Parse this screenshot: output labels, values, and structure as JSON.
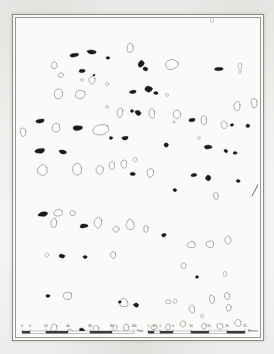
{
  "document": {
    "type": "archaeological-site-plan",
    "media": "scanned printed page",
    "paper_color": "#f4f3f1",
    "ink_color": "#1a1a1a",
    "outline_color": "#6b6966",
    "frame_color": "#8e8c89"
  },
  "map": {
    "north_arrow": {
      "name": "north-arrow",
      "label": "N",
      "bearing_deg": 28,
      "x": 236,
      "y": 178,
      "length": 26
    },
    "legend": {
      "filled_meaning": "stone shown solid (upright / visible)",
      "outline_meaning": "stone shown in outline (fallen / buried)"
    },
    "stones_filled": [
      {
        "x": 58,
        "y": 37,
        "rx": 5.0,
        "ry": 2.0,
        "rot": -8
      },
      {
        "x": 76,
        "y": 34,
        "rx": 5.5,
        "ry": 1.9,
        "rot": 4
      },
      {
        "x": 92,
        "y": 40,
        "rx": 1.9,
        "ry": 1.6,
        "rot": 0
      },
      {
        "x": 66,
        "y": 53,
        "rx": 3.6,
        "ry": 1.8,
        "rot": -6
      },
      {
        "x": 78,
        "y": 57,
        "rx": 1.2,
        "ry": 1.0,
        "rot": 0
      },
      {
        "x": 125,
        "y": 46,
        "rx": 3.0,
        "ry": 3.6,
        "rot": 22
      },
      {
        "x": 129,
        "y": 51,
        "rx": 2.6,
        "ry": 2.0,
        "rot": 10
      },
      {
        "x": 203,
        "y": 51,
        "rx": 5.0,
        "ry": 1.9,
        "rot": -2
      },
      {
        "x": 250,
        "y": 52,
        "rx": 2.2,
        "ry": 1.7,
        "rot": 0
      },
      {
        "x": 117,
        "y": 74,
        "rx": 3.6,
        "ry": 1.8,
        "rot": -5
      },
      {
        "x": 133,
        "y": 71,
        "rx": 4.0,
        "ry": 3.0,
        "rot": 14
      },
      {
        "x": 140,
        "y": 75,
        "rx": 2.2,
        "ry": 1.6,
        "rot": 0
      },
      {
        "x": 24,
        "y": 103,
        "rx": 4.2,
        "ry": 2.2,
        "rot": -10
      },
      {
        "x": 62,
        "y": 110,
        "rx": 5.2,
        "ry": 2.6,
        "rot": -4
      },
      {
        "x": 122,
        "y": 95,
        "rx": 3.2,
        "ry": 2.4,
        "rot": 16
      },
      {
        "x": 116,
        "y": 93,
        "rx": 1.6,
        "ry": 1.4,
        "rot": 0
      },
      {
        "x": 176,
        "y": 102,
        "rx": 3.2,
        "ry": 2.0,
        "rot": -6
      },
      {
        "x": 216,
        "y": 107,
        "rx": 2.0,
        "ry": 1.6,
        "rot": 0
      },
      {
        "x": 232,
        "y": 108,
        "rx": 2.3,
        "ry": 1.8,
        "rot": 0
      },
      {
        "x": 95,
        "y": 120,
        "rx": 1.9,
        "ry": 1.7,
        "rot": 0
      },
      {
        "x": 109,
        "y": 120,
        "rx": 3.4,
        "ry": 1.9,
        "rot": -8
      },
      {
        "x": 24,
        "y": 133,
        "rx": 5.4,
        "ry": 2.5,
        "rot": -9
      },
      {
        "x": 47,
        "y": 134,
        "rx": 4.0,
        "ry": 2.4,
        "rot": 12
      },
      {
        "x": 150,
        "y": 127,
        "rx": 2.3,
        "ry": 2.0,
        "rot": 0
      },
      {
        "x": 192,
        "y": 129,
        "rx": 4.0,
        "ry": 2.0,
        "rot": -5
      },
      {
        "x": 210,
        "y": 133,
        "rx": 2.1,
        "ry": 1.8,
        "rot": 0
      },
      {
        "x": 219,
        "y": 135,
        "rx": 1.9,
        "ry": 1.6,
        "rot": 0
      },
      {
        "x": 159,
        "y": 172,
        "rx": 2.0,
        "ry": 1.7,
        "rot": 0
      },
      {
        "x": 117,
        "y": 156,
        "rx": 2.8,
        "ry": 2.0,
        "rot": 0
      },
      {
        "x": 178,
        "y": 157,
        "rx": 3.2,
        "ry": 2.0,
        "rot": -4
      },
      {
        "x": 192,
        "y": 160,
        "rx": 3.0,
        "ry": 3.4,
        "rot": 18
      },
      {
        "x": 222,
        "y": 163,
        "rx": 2.0,
        "ry": 1.7,
        "rot": 0
      },
      {
        "x": 27,
        "y": 196,
        "rx": 5.4,
        "ry": 2.6,
        "rot": -10
      },
      {
        "x": 68,
        "y": 208,
        "rx": 4.4,
        "ry": 2.3,
        "rot": -6
      },
      {
        "x": 148,
        "y": 217,
        "rx": 2.3,
        "ry": 1.9,
        "rot": 0
      },
      {
        "x": 46,
        "y": 238,
        "rx": 3.0,
        "ry": 2.0,
        "rot": 14
      },
      {
        "x": 69,
        "y": 239,
        "rx": 2.1,
        "ry": 1.7,
        "rot": 0
      },
      {
        "x": 181,
        "y": 259,
        "rx": 1.7,
        "ry": 1.5,
        "rot": 0
      },
      {
        "x": 32,
        "y": 278,
        "rx": 2.2,
        "ry": 1.7,
        "rot": 0
      },
      {
        "x": 120,
        "y": 287,
        "rx": 2.8,
        "ry": 2.2,
        "rot": 0
      },
      {
        "x": 66,
        "y": 312,
        "rx": 3.0,
        "ry": 2.2,
        "rot": 18
      },
      {
        "x": 104,
        "y": 284,
        "rx": 1.6,
        "ry": 1.4,
        "rot": 0
      }
    ],
    "stones_outline": [
      {
        "x": 114,
        "y": 30,
        "rx": 3.4,
        "ry": 4.6,
        "rot": 6
      },
      {
        "x": 38,
        "y": 47,
        "rx": 3.0,
        "ry": 3.6,
        "rot": -8
      },
      {
        "x": 45,
        "y": 57,
        "rx": 2.8,
        "ry": 2.6,
        "rot": 0
      },
      {
        "x": 76,
        "y": 62,
        "rx": 3.0,
        "ry": 4.0,
        "rot": 4
      },
      {
        "x": 91,
        "y": 66,
        "rx": 1.8,
        "ry": 1.6,
        "rot": 0
      },
      {
        "x": 156,
        "y": 47,
        "rx": 7.0,
        "ry": 5.2,
        "rot": -8
      },
      {
        "x": 224,
        "y": 48,
        "rx": 2.0,
        "ry": 3.4,
        "rot": 0
      },
      {
        "x": 224,
        "y": 54,
        "rx": 1.5,
        "ry": 1.4,
        "rot": 0
      },
      {
        "x": 43,
        "y": 76,
        "rx": 4.6,
        "ry": 5.4,
        "rot": 8
      },
      {
        "x": 64,
        "y": 76,
        "rx": 5.6,
        "ry": 4.8,
        "rot": -6
      },
      {
        "x": 151,
        "y": 77,
        "rx": 1.8,
        "ry": 1.7,
        "rot": 0
      },
      {
        "x": 221,
        "y": 88,
        "rx": 3.4,
        "ry": 5.2,
        "rot": 10
      },
      {
        "x": 238,
        "y": 85,
        "rx": 3.2,
        "ry": 4.6,
        "rot": -6
      },
      {
        "x": 91,
        "y": 89,
        "rx": 1.6,
        "ry": 1.5,
        "rot": 0
      },
      {
        "x": 104,
        "y": 95,
        "rx": 3.0,
        "ry": 5.2,
        "rot": 6
      },
      {
        "x": 136,
        "y": 96,
        "rx": 3.2,
        "ry": 5.0,
        "rot": -4
      },
      {
        "x": 161,
        "y": 96,
        "rx": 4.6,
        "ry": 4.6,
        "rot": 12
      },
      {
        "x": 158,
        "y": 104,
        "rx": 1.4,
        "ry": 1.3,
        "rot": 0
      },
      {
        "x": 188,
        "y": 102,
        "rx": 3.0,
        "ry": 4.4,
        "rot": 0
      },
      {
        "x": 7,
        "y": 114,
        "rx": 3.2,
        "ry": 4.4,
        "rot": 4
      },
      {
        "x": 40,
        "y": 110,
        "rx": 4.2,
        "ry": 5.0,
        "rot": -8
      },
      {
        "x": 84,
        "y": 112,
        "rx": 8.8,
        "ry": 6.0,
        "rot": -12
      },
      {
        "x": 208,
        "y": 107,
        "rx": 3.4,
        "ry": 4.2,
        "rot": 0
      },
      {
        "x": 108,
        "y": 146,
        "rx": 3.0,
        "ry": 4.2,
        "rot": 0
      },
      {
        "x": 119,
        "y": 142,
        "rx": 2.2,
        "ry": 2.6,
        "rot": 0
      },
      {
        "x": 27,
        "y": 152,
        "rx": 5.2,
        "ry": 6.0,
        "rot": -6
      },
      {
        "x": 61,
        "y": 152,
        "rx": 5.0,
        "ry": 6.6,
        "rot": 8
      },
      {
        "x": 84,
        "y": 152,
        "rx": 4.0,
        "ry": 5.4,
        "rot": -4
      },
      {
        "x": 96,
        "y": 147,
        "rx": 3.2,
        "ry": 4.2,
        "rot": 0
      },
      {
        "x": 134,
        "y": 155,
        "rx": 3.4,
        "ry": 4.8,
        "rot": 6
      },
      {
        "x": 196,
        "y": 2,
        "rx": 2.0,
        "ry": 3.0,
        "rot": 0
      },
      {
        "x": 200,
        "y": 178,
        "rx": 2.6,
        "ry": 3.6,
        "rot": 0
      },
      {
        "x": 42,
        "y": 195,
        "rx": 4.4,
        "ry": 4.0,
        "rot": -8
      },
      {
        "x": 57,
        "y": 195,
        "rx": 3.0,
        "ry": 2.6,
        "rot": 0
      },
      {
        "x": 38,
        "y": 205,
        "rx": 3.2,
        "ry": 5.2,
        "rot": 6
      },
      {
        "x": 82,
        "y": 205,
        "rx": 4.0,
        "ry": 6.0,
        "rot": 0
      },
      {
        "x": 100,
        "y": 211,
        "rx": 3.2,
        "ry": 3.6,
        "rot": 10
      },
      {
        "x": 114,
        "y": 206,
        "rx": 4.2,
        "ry": 5.6,
        "rot": -4
      },
      {
        "x": 130,
        "y": 211,
        "rx": 2.8,
        "ry": 3.6,
        "rot": 0
      },
      {
        "x": 175,
        "y": 227,
        "rx": 4.4,
        "ry": 3.6,
        "rot": -10
      },
      {
        "x": 194,
        "y": 226,
        "rx": 4.0,
        "ry": 3.2,
        "rot": 8
      },
      {
        "x": 212,
        "y": 222,
        "rx": 3.4,
        "ry": 4.2,
        "rot": 0
      },
      {
        "x": 31,
        "y": 237,
        "rx": 2.2,
        "ry": 2.0,
        "rot": 0
      },
      {
        "x": 97,
        "y": 237,
        "rx": 2.6,
        "ry": 3.4,
        "rot": 0
      },
      {
        "x": 168,
        "y": 248,
        "rx": 2.8,
        "ry": 3.4,
        "rot": 0
      },
      {
        "x": 209,
        "y": 256,
        "rx": 1.9,
        "ry": 2.8,
        "rot": 0
      },
      {
        "x": 51,
        "y": 278,
        "rx": 4.6,
        "ry": 4.2,
        "rot": -6
      },
      {
        "x": 108,
        "y": 285,
        "rx": 4.0,
        "ry": 4.6,
        "rot": 0
      },
      {
        "x": 152,
        "y": 284,
        "rx": 2.6,
        "ry": 2.2,
        "rot": 0
      },
      {
        "x": 159,
        "y": 283,
        "rx": 2.0,
        "ry": 2.6,
        "rot": 0
      },
      {
        "x": 196,
        "y": 281,
        "rx": 3.0,
        "ry": 4.6,
        "rot": 0
      },
      {
        "x": 211,
        "y": 278,
        "rx": 3.2,
        "ry": 4.0,
        "rot": 0
      },
      {
        "x": 176,
        "y": 291,
        "rx": 3.0,
        "ry": 4.2,
        "rot": 0
      },
      {
        "x": 213,
        "y": 290,
        "rx": 3.0,
        "ry": 3.6,
        "rot": 0
      },
      {
        "x": 38,
        "y": 310,
        "rx": 3.4,
        "ry": 3.8,
        "rot": -8
      },
      {
        "x": 54,
        "y": 313,
        "rx": 2.4,
        "ry": 2.2,
        "rot": 0
      },
      {
        "x": 80,
        "y": 311,
        "rx": 3.0,
        "ry": 3.4,
        "rot": 0
      },
      {
        "x": 99,
        "y": 310,
        "rx": 2.2,
        "ry": 3.6,
        "rot": 0
      },
      {
        "x": 110,
        "y": 310,
        "rx": 2.4,
        "ry": 3.8,
        "rot": 0
      },
      {
        "x": 138,
        "y": 309,
        "rx": 4.0,
        "ry": 2.6,
        "rot": -12
      },
      {
        "x": 152,
        "y": 309,
        "rx": 2.8,
        "ry": 3.2,
        "rot": 0
      },
      {
        "x": 167,
        "y": 306,
        "rx": 3.2,
        "ry": 3.6,
        "rot": 0
      },
      {
        "x": 188,
        "y": 308,
        "rx": 2.6,
        "ry": 3.0,
        "rot": 0
      },
      {
        "x": 204,
        "y": 308,
        "rx": 3.0,
        "ry": 3.2,
        "rot": 0
      },
      {
        "x": 222,
        "y": 305,
        "rx": 3.6,
        "ry": 4.0,
        "rot": 0
      },
      {
        "x": 186,
        "y": 298,
        "rx": 1.6,
        "ry": 2.0,
        "rot": 0
      },
      {
        "x": 66,
        "y": 62,
        "rx": 1.5,
        "ry": 1.4,
        "rot": 0
      },
      {
        "x": 183,
        "y": 120,
        "rx": 1.6,
        "ry": 1.5,
        "rot": 0
      }
    ]
  },
  "scalebar_imperial": {
    "name": "imperial-scale-bar",
    "unit_label": "Feet",
    "ticks": [
      "0",
      "5",
      "20",
      "40",
      "60",
      "80",
      "100"
    ],
    "tick_positions": [
      0,
      8,
      24,
      46,
      68,
      90,
      112
    ]
  },
  "scalebar_metric": {
    "name": "metric-scale-bar",
    "unit_label": "Metres",
    "ticks": [
      "1",
      "0",
      "1",
      "5",
      "10",
      "15",
      "20",
      "25"
    ],
    "tick_positions": [
      0,
      6,
      12,
      25,
      43,
      61,
      79,
      97
    ]
  }
}
